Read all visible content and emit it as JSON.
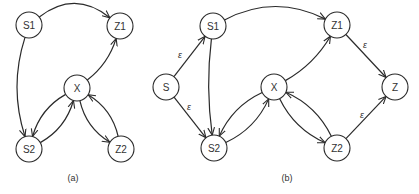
{
  "colors": {
    "stroke": "#2a2a2a",
    "text": "#333333",
    "background": "#ffffff"
  },
  "node_radius": 13,
  "diagrams": [
    {
      "id": "a",
      "caption": "(a)",
      "caption_pos": [
        73,
        178
      ],
      "nodes": [
        {
          "id": "S1",
          "label": "S1",
          "x": 29,
          "y": 25
        },
        {
          "id": "Z1",
          "label": "Z1",
          "x": 120,
          "y": 26
        },
        {
          "id": "X",
          "label": "X",
          "x": 77,
          "y": 88
        },
        {
          "id": "S2",
          "label": "S2",
          "x": 29,
          "y": 149
        },
        {
          "id": "Z2",
          "label": "Z2",
          "x": 121,
          "y": 149
        }
      ],
      "edges": [
        {
          "from": "S1",
          "to": "Z1",
          "label": "",
          "bend": -18
        },
        {
          "from": "S1",
          "to": "S2",
          "label": "",
          "bend": 10
        },
        {
          "from": "X",
          "to": "Z1",
          "label": "",
          "bend": 6
        },
        {
          "from": "X",
          "to": "S2",
          "label": "",
          "bend": 8
        },
        {
          "from": "S2",
          "to": "X",
          "label": "",
          "bend": 8
        },
        {
          "from": "X",
          "to": "Z2",
          "label": "",
          "bend": 8
        },
        {
          "from": "Z2",
          "to": "X",
          "label": "",
          "bend": 8
        }
      ]
    },
    {
      "id": "b",
      "caption": "(b)",
      "caption_pos": [
        287,
        178
      ],
      "nodes": [
        {
          "id": "S",
          "label": "S",
          "x": 166,
          "y": 87
        },
        {
          "id": "S1",
          "label": "S1",
          "x": 213,
          "y": 26
        },
        {
          "id": "S2",
          "label": "S2",
          "x": 214,
          "y": 148
        },
        {
          "id": "X",
          "label": "X",
          "x": 274,
          "y": 87
        },
        {
          "id": "Z1",
          "label": "Z1",
          "x": 337,
          "y": 25
        },
        {
          "id": "Z2",
          "label": "Z2",
          "x": 337,
          "y": 148
        },
        {
          "id": "Z",
          "label": "Z",
          "x": 395,
          "y": 87
        }
      ],
      "edges": [
        {
          "from": "S",
          "to": "S1",
          "label": "ε",
          "bend": 0,
          "label_pos": [
            180,
            55
          ]
        },
        {
          "from": "S",
          "to": "S2",
          "label": "ε",
          "bend": 0,
          "label_pos": [
            189,
            107
          ]
        },
        {
          "from": "S1",
          "to": "Z1",
          "label": "",
          "bend": -16
        },
        {
          "from": "S1",
          "to": "S2",
          "label": "",
          "bend": 4
        },
        {
          "from": "X",
          "to": "Z1",
          "label": "",
          "bend": 6
        },
        {
          "from": "X",
          "to": "S2",
          "label": "",
          "bend": 8
        },
        {
          "from": "S2",
          "to": "X",
          "label": "",
          "bend": 8
        },
        {
          "from": "X",
          "to": "Z2",
          "label": "",
          "bend": 8
        },
        {
          "from": "Z2",
          "to": "X",
          "label": "",
          "bend": 8
        },
        {
          "from": "Z1",
          "to": "Z",
          "label": "ε",
          "bend": 0,
          "label_pos": [
            365,
            45
          ]
        },
        {
          "from": "Z2",
          "to": "Z",
          "label": "ε",
          "bend": 0,
          "label_pos": [
            362,
            115
          ]
        }
      ]
    }
  ]
}
